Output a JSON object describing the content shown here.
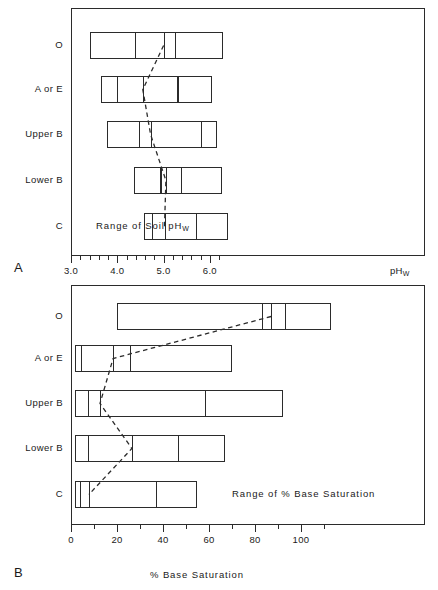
{
  "figure": {
    "panels": [
      {
        "letter": "A",
        "annotation": "Range of Soil pH",
        "annotation_sub": "W",
        "axis_caption": "pH",
        "axis_caption_sub": "W",
        "xtitle": ""
      },
      {
        "letter": "B",
        "annotation": "Range of % Base Saturation",
        "annotation_sub": "",
        "axis_caption": "",
        "axis_caption_sub": "",
        "xtitle": "% Base Saturation"
      }
    ],
    "horizons": [
      "O",
      "A or E",
      "Upper B",
      "Lower B",
      "C"
    ]
  },
  "chart_data": [
    {
      "type": "bar",
      "orientation": "horizontal",
      "panel": "A",
      "title": "Range of Soil pHw",
      "xlabel": "pHw",
      "ylabel": "Soil horizon",
      "xlim": [
        3.0,
        6.65
      ],
      "xticks_major": [
        3.0,
        4.0,
        5.0,
        6.0
      ],
      "xticklabels": [
        "3.0",
        "4.0",
        "5.0",
        "6.0"
      ],
      "xticks_minor": [
        3.2,
        3.4,
        3.6,
        3.8,
        4.2,
        4.4,
        4.6,
        4.8,
        5.2,
        5.4,
        5.6,
        5.8,
        6.2
      ],
      "grid": false,
      "legend": "none",
      "categories": [
        "O",
        "A or E",
        "Upper B",
        "Lower B",
        "C"
      ],
      "series": [
        {
          "name": "O",
          "range_min": 3.41,
          "range_max": 9.78,
          "segments": [
            3.41,
            5.38,
            6.99,
            8.24,
            9.78
          ],
          "median": 5.38
        },
        {
          "name": "A or E",
          "range_min": 4.36,
          "range_max": 9.91,
          "segments": [
            4.36,
            5.29,
            6.2,
            7.3,
            9.91
          ],
          "median": 6.2
        },
        {
          "name": "Upper B",
          "range_min": 4.6,
          "range_max": 9.15,
          "segments": [
            4.6,
            6.24,
            6.69,
            8.94,
            9.15
          ],
          "median": 6.69
        },
        {
          "name": "Lower B",
          "range_min": 5.36,
          "range_max": 9.07,
          "segments": [
            5.36,
            6.33,
            7.19,
            7.75,
            9.07
          ],
          "median": 7.19
        },
        {
          "name": "C",
          "range_min": 6.24,
          "range_max": 9.4,
          "segments": [
            6.24,
            6.65,
            7.15,
            8.1,
            9.4
          ],
          "median": 7.15
        }
      ],
      "note": "Values above are in pixel-derived pH units; see ph_values for real scale",
      "ph_values": {
        "O": {
          "min": 3.41,
          "q1": 4.38,
          "median": 5.0,
          "q3": 5.25,
          "max": 6.28
        },
        "A or E": {
          "min": 3.64,
          "q1": 3.99,
          "median": 4.55,
          "q3": 5.3,
          "max": 6.05
        },
        "Upper B": {
          "min": 3.78,
          "q1": 4.46,
          "median": 4.72,
          "q3": 5.8,
          "max": 6.15
        },
        "Lower B": {
          "min": 4.35,
          "q1": 4.93,
          "median": 5.05,
          "q3": 5.38,
          "max": 6.26
        },
        "C": {
          "min": 4.58,
          "q1": 4.74,
          "median": 5.02,
          "q3": 5.7,
          "max": 6.39
        }
      }
    },
    {
      "type": "bar",
      "orientation": "horizontal",
      "panel": "B",
      "title": "Range of % Base Saturation",
      "xlabel": "% Base Saturation",
      "ylabel": "Soil horizon",
      "xlim": [
        0,
        159
      ],
      "xticks_major": [
        0,
        20,
        40,
        60,
        80,
        100
      ],
      "xticklabels": [
        "0",
        "20",
        "40",
        "60",
        "80",
        "100"
      ],
      "xticks_minor": [
        10,
        30,
        50,
        70,
        90,
        110
      ],
      "grid": false,
      "legend": "none",
      "categories": [
        "O",
        "A or E",
        "Upper B",
        "Lower B",
        "C"
      ],
      "base_saturation_values": {
        "O": {
          "min": 20.0,
          "q1": 83.0,
          "median": 87.0,
          "q3": 93.0,
          "max": 113.0
        },
        "A or E": {
          "min": 1.7,
          "q1": 4.3,
          "median": 18.3,
          "q3": 25.7,
          "max": 70.0
        },
        "Upper B": {
          "min": 1.7,
          "q1": 7.4,
          "median": 12.6,
          "q3": 58.3,
          "max": 92.2
        },
        "Lower B": {
          "min": 1.7,
          "q1": 7.4,
          "median": 26.5,
          "q3": 46.5,
          "max": 66.9
        },
        "C": {
          "min": 1.7,
          "q1": 3.9,
          "median": 7.8,
          "q3": 37.0,
          "max": 54.8
        }
      }
    }
  ]
}
